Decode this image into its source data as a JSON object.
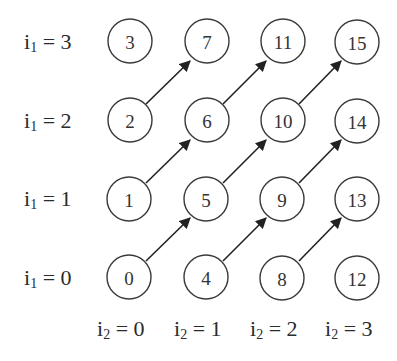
{
  "diagram": {
    "title": "",
    "row_labels": [
      {
        "var": "i",
        "sub": "1",
        "eq": " = 3",
        "value": 3
      },
      {
        "var": "i",
        "sub": "1",
        "eq": " = 2",
        "value": 2
      },
      {
        "var": "i",
        "sub": "1",
        "eq": " = 1",
        "value": 1
      },
      {
        "var": "i",
        "sub": "1",
        "eq": " = 0",
        "value": 0
      }
    ],
    "col_labels": [
      {
        "var": "i",
        "sub": "2",
        "eq": " = 0",
        "value": 0
      },
      {
        "var": "i",
        "sub": "2",
        "eq": " = 1",
        "value": 1
      },
      {
        "var": "i",
        "sub": "2",
        "eq": " = 2",
        "value": 2
      },
      {
        "var": "i",
        "sub": "2",
        "eq": " = 3",
        "value": 3
      }
    ],
    "grid": [
      [
        "3",
        "7",
        "11",
        "15"
      ],
      [
        "2",
        "6",
        "10",
        "14"
      ],
      [
        "1",
        "5",
        "9",
        "13"
      ],
      [
        "0",
        "4",
        "8",
        "12"
      ]
    ],
    "arrows": [
      {
        "from": "0",
        "to": "5"
      },
      {
        "from": "1",
        "to": "6"
      },
      {
        "from": "2",
        "to": "7"
      },
      {
        "from": "4",
        "to": "9"
      },
      {
        "from": "5",
        "to": "10"
      },
      {
        "from": "6",
        "to": "11"
      },
      {
        "from": "8",
        "to": "13"
      },
      {
        "from": "9",
        "to": "14"
      },
      {
        "from": "10",
        "to": "15"
      }
    ],
    "colors": {
      "node_stroke": "#3a3a3a",
      "arrow": "#222222",
      "text": "#333333",
      "background": "#ffffff"
    }
  }
}
